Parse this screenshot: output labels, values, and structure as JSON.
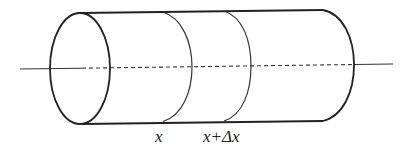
{
  "figure": {
    "labels": {
      "x": "x",
      "x_plus_dx": "x+Δx"
    },
    "colors": {
      "stroke": "#222222",
      "background": "#ffffff"
    }
  }
}
